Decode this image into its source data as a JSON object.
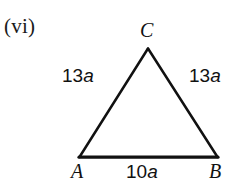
{
  "figure": {
    "item_tag": "(vi)",
    "background_color": "#ffffff",
    "stroke_color": "#111111",
    "shape": "isosceles-triangle",
    "vertices": [
      {
        "name": "A",
        "label": "A",
        "x": 79,
        "y": 157,
        "position": "bottom-left"
      },
      {
        "name": "B",
        "label": "B",
        "x": 218,
        "y": 157,
        "position": "bottom-right"
      },
      {
        "name": "C",
        "label": "C",
        "x": 148,
        "y": 48,
        "position": "apex"
      }
    ],
    "sides": [
      {
        "name": "side-AC",
        "label_number": "13",
        "label_variable": "a",
        "label": "13a",
        "position": "left"
      },
      {
        "name": "side-BC",
        "label_number": "13",
        "label_variable": "a",
        "label": "13a",
        "position": "right"
      },
      {
        "name": "side-AB",
        "label_number": "10",
        "label_variable": "a",
        "label": "10a",
        "position": "base"
      }
    ]
  }
}
